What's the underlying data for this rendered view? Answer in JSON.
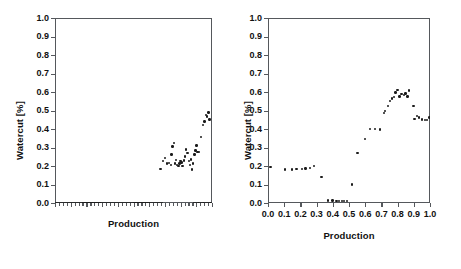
{
  "figure": {
    "background": "#ffffff",
    "marker_color": "#1b1b1b",
    "axis_color": "#55585c"
  },
  "chart_data": [
    {
      "id": "left",
      "type": "scatter",
      "title": "",
      "xlabel": "Production",
      "ylabel": "Watercut [%]",
      "xlim": [
        0.0,
        1.0
      ],
      "ylim": [
        0.0,
        1.0
      ],
      "grid": false,
      "legend": null,
      "x_tick_labels_visible": false,
      "ytick_labels": [
        "0.0",
        "0.1",
        "0.2",
        "0.3",
        "0.4",
        "0.5",
        "0.6",
        "0.7",
        "0.8",
        "0.9",
        "1.0"
      ],
      "ytick_values": [
        0.0,
        0.1,
        0.2,
        0.3,
        0.4,
        0.5,
        0.6,
        0.7,
        0.8,
        0.9,
        1.0
      ],
      "xtick_values": [
        0.0,
        0.1,
        0.2,
        0.3,
        0.4,
        0.5,
        0.6,
        0.7,
        0.8,
        0.9,
        1.0
      ],
      "note": "x axis has tick marks but no numeric tick labels; dense row of markers lies at y=0 across full width; elevated cluster occupies right portion",
      "points": [
        [
          0.005,
          0.0
        ],
        [
          0.018,
          0.0
        ],
        [
          0.031,
          0.0
        ],
        [
          0.044,
          0.0
        ],
        [
          0.057,
          0.0
        ],
        [
          0.07,
          0.0
        ],
        [
          0.083,
          0.0
        ],
        [
          0.096,
          0.0
        ],
        [
          0.109,
          0.0
        ],
        [
          0.122,
          0.0
        ],
        [
          0.135,
          0.0
        ],
        [
          0.148,
          0.0
        ],
        [
          0.161,
          0.0
        ],
        [
          0.174,
          0.0
        ],
        [
          0.187,
          0.0
        ],
        [
          0.2,
          0.0
        ],
        [
          0.213,
          0.0
        ],
        [
          0.226,
          0.0
        ],
        [
          0.239,
          0.0
        ],
        [
          0.252,
          0.0
        ],
        [
          0.265,
          0.0
        ],
        [
          0.278,
          0.0
        ],
        [
          0.291,
          0.0
        ],
        [
          0.304,
          0.0
        ],
        [
          0.317,
          0.0
        ],
        [
          0.33,
          0.0
        ],
        [
          0.343,
          0.0
        ],
        [
          0.356,
          0.0
        ],
        [
          0.369,
          0.0
        ],
        [
          0.382,
          0.0
        ],
        [
          0.395,
          0.0
        ],
        [
          0.408,
          0.0
        ],
        [
          0.421,
          0.0
        ],
        [
          0.434,
          0.0
        ],
        [
          0.447,
          0.0
        ],
        [
          0.46,
          0.0
        ],
        [
          0.473,
          0.0
        ],
        [
          0.486,
          0.0
        ],
        [
          0.499,
          0.0
        ],
        [
          0.512,
          0.0
        ],
        [
          0.525,
          0.0
        ],
        [
          0.538,
          0.0
        ],
        [
          0.551,
          0.0
        ],
        [
          0.564,
          0.0
        ],
        [
          0.577,
          0.0
        ],
        [
          0.59,
          0.0
        ],
        [
          0.603,
          0.0
        ],
        [
          0.616,
          0.0
        ],
        [
          0.629,
          0.0
        ],
        [
          0.642,
          0.0
        ],
        [
          0.655,
          0.0
        ],
        [
          0.668,
          0.0
        ],
        [
          0.681,
          0.0
        ],
        [
          0.885,
          0.0
        ],
        [
          0.9,
          0.0
        ],
        [
          0.915,
          0.0
        ],
        [
          0.93,
          0.0
        ],
        [
          0.945,
          0.0
        ],
        [
          0.96,
          0.0
        ],
        [
          0.975,
          0.0
        ],
        [
          0.99,
          0.0
        ],
        [
          0.672,
          0.183
        ],
        [
          0.688,
          0.228
        ],
        [
          0.7,
          0.243
        ],
        [
          0.712,
          0.214
        ],
        [
          0.726,
          0.215
        ],
        [
          0.737,
          0.206
        ],
        [
          0.742,
          0.262
        ],
        [
          0.748,
          0.305
        ],
        [
          0.758,
          0.325
        ],
        [
          0.766,
          0.213
        ],
        [
          0.772,
          0.232
        ],
        [
          0.778,
          0.206
        ],
        [
          0.786,
          0.199
        ],
        [
          0.793,
          0.213
        ],
        [
          0.8,
          0.226
        ],
        [
          0.806,
          0.218
        ],
        [
          0.812,
          0.199
        ],
        [
          0.82,
          0.23
        ],
        [
          0.828,
          0.252
        ],
        [
          0.836,
          0.289
        ],
        [
          0.844,
          0.27
        ],
        [
          0.852,
          0.226
        ],
        [
          0.858,
          0.205
        ],
        [
          0.866,
          0.236
        ],
        [
          0.874,
          0.182
        ],
        [
          0.88,
          0.214
        ],
        [
          0.888,
          0.262
        ],
        [
          0.896,
          0.283
        ],
        [
          0.902,
          0.311
        ],
        [
          0.908,
          0.276
        ],
        [
          0.918,
          0.276
        ],
        [
          0.93,
          0.356
        ],
        [
          0.944,
          0.42
        ],
        [
          0.952,
          0.44
        ],
        [
          0.962,
          0.476
        ],
        [
          0.97,
          0.468
        ],
        [
          0.978,
          0.49
        ],
        [
          0.984,
          0.452
        ]
      ]
    },
    {
      "id": "right",
      "type": "scatter",
      "title": "",
      "xlabel": "Production",
      "ylabel": "Watercut [%]",
      "xlim": [
        0.0,
        1.0
      ],
      "ylim": [
        0.0,
        1.0
      ],
      "grid": false,
      "legend": null,
      "x_tick_labels_visible": true,
      "ytick_labels": [
        "0.0",
        "0.1",
        "0.2",
        "0.3",
        "0.4",
        "0.5",
        "0.6",
        "0.7",
        "0.8",
        "0.9",
        "1.0"
      ],
      "ytick_values": [
        0.0,
        0.1,
        0.2,
        0.3,
        0.4,
        0.5,
        0.6,
        0.7,
        0.8,
        0.9,
        1.0
      ],
      "xtick_labels": [
        "0.0",
        "0.1",
        "0.2",
        "0.3",
        "0.4",
        "0.5",
        "0.6",
        "0.7",
        "0.8",
        "0.9",
        "1.0"
      ],
      "xtick_values": [
        0.0,
        0.1,
        0.2,
        0.3,
        0.4,
        0.5,
        0.6,
        0.7,
        0.8,
        0.9,
        1.0
      ],
      "note": "sorted watercut curve: ~0.19 plateau, dip near 0.33, near-zero band 0.37-0.49, rise to peak ~0.61 at x~0.87, then decline to ~0.45",
      "points": [
        [
          0.015,
          0.193
        ],
        [
          0.105,
          0.181
        ],
        [
          0.15,
          0.182
        ],
        [
          0.175,
          0.183
        ],
        [
          0.21,
          0.184
        ],
        [
          0.232,
          0.186
        ],
        [
          0.258,
          0.189
        ],
        [
          0.283,
          0.201
        ],
        [
          0.33,
          0.141
        ],
        [
          0.372,
          0.014
        ],
        [
          0.398,
          0.013
        ],
        [
          0.422,
          0.012
        ],
        [
          0.44,
          0.012
        ],
        [
          0.455,
          0.012
        ],
        [
          0.47,
          0.012
        ],
        [
          0.488,
          0.012
        ],
        [
          0.52,
          0.1
        ],
        [
          0.552,
          0.27
        ],
        [
          0.6,
          0.345
        ],
        [
          0.63,
          0.4
        ],
        [
          0.66,
          0.399
        ],
        [
          0.69,
          0.398
        ],
        [
          0.715,
          0.485
        ],
        [
          0.722,
          0.498
        ],
        [
          0.742,
          0.525
        ],
        [
          0.752,
          0.55
        ],
        [
          0.765,
          0.565
        ],
        [
          0.778,
          0.572
        ],
        [
          0.788,
          0.598
        ],
        [
          0.8,
          0.612
        ],
        [
          0.812,
          0.575
        ],
        [
          0.824,
          0.588
        ],
        [
          0.838,
          0.585
        ],
        [
          0.848,
          0.592
        ],
        [
          0.862,
          0.575
        ],
        [
          0.872,
          0.608
        ],
        [
          0.898,
          0.525
        ],
        [
          0.905,
          0.455
        ],
        [
          0.918,
          0.47
        ],
        [
          0.932,
          0.462
        ],
        [
          0.952,
          0.452
        ],
        [
          0.968,
          0.448
        ],
        [
          0.982,
          0.447
        ],
        [
          0.998,
          0.462
        ]
      ]
    }
  ]
}
